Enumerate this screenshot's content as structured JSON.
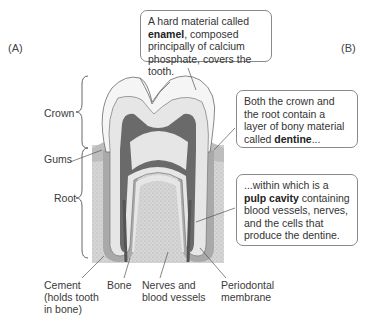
{
  "panels": {
    "a": "(A)",
    "b": "(B)"
  },
  "callouts": {
    "enamel": {
      "pre": "A hard material called ",
      "bold": "enamel",
      "post": ", composed principally of calcium phosphate, covers the tooth."
    },
    "dentine": {
      "pre": "Both the crown and the root contain a layer of bony material called ",
      "bold": "dentine",
      "post": "..."
    },
    "pulp": {
      "pre": "...within which is a ",
      "bold": "pulp cavity",
      "post": " containing blood vessels, nerves, and the cells that produce the dentine."
    }
  },
  "labels": {
    "crown": "Crown",
    "gums": "Gums",
    "root": "Root",
    "cement_1": "Cement",
    "cement_2": "(holds tooth",
    "cement_3": "in bone)",
    "bone": "Bone",
    "nerves_1": "Nerves and",
    "nerves_2": "blood vessels",
    "periodontal_1": "Periodontal",
    "periodontal_2": "membrane"
  },
  "colors": {
    "enamel": "#f4f4f4",
    "dentine": "#e2e2e2",
    "pulp": "#6e6e6e",
    "bone": "#cfcfcf",
    "gum": "#b8b8b8",
    "outline": "#555555"
  }
}
